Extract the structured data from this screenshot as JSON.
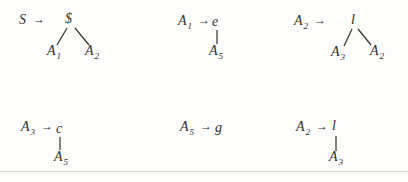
{
  "figure": {
    "colors": {
      "ink": "#322f2c",
      "background": "#fdfdfc",
      "rule": "#d6d6d4"
    },
    "productions": [
      {
        "lhs": {
          "base": "S",
          "sub": ""
        },
        "arrow": "→",
        "root": "$",
        "children": [
          {
            "base": "A",
            "sub": "1"
          },
          {
            "base": "A",
            "sub": "2"
          }
        ]
      },
      {
        "lhs": {
          "base": "A",
          "sub": "1"
        },
        "arrow": "→",
        "root": "e",
        "children": [
          {
            "base": "A",
            "sub": "5"
          }
        ]
      },
      {
        "lhs": {
          "base": "A",
          "sub": "2"
        },
        "arrow": "→",
        "root": "l",
        "children": [
          {
            "base": "A",
            "sub": "3"
          },
          {
            "base": "A",
            "sub": "2"
          }
        ]
      },
      {
        "lhs": {
          "base": "A",
          "sub": "3"
        },
        "arrow": "→",
        "root": "c",
        "children": [
          {
            "base": "A",
            "sub": "5"
          }
        ]
      },
      {
        "lhs": {
          "base": "A",
          "sub": "5"
        },
        "arrow": "→",
        "root": "g",
        "children": []
      },
      {
        "lhs": {
          "base": "A",
          "sub": "2"
        },
        "arrow": "→",
        "root": "l",
        "children": [
          {
            "base": "A",
            "sub": "3"
          }
        ]
      }
    ]
  }
}
